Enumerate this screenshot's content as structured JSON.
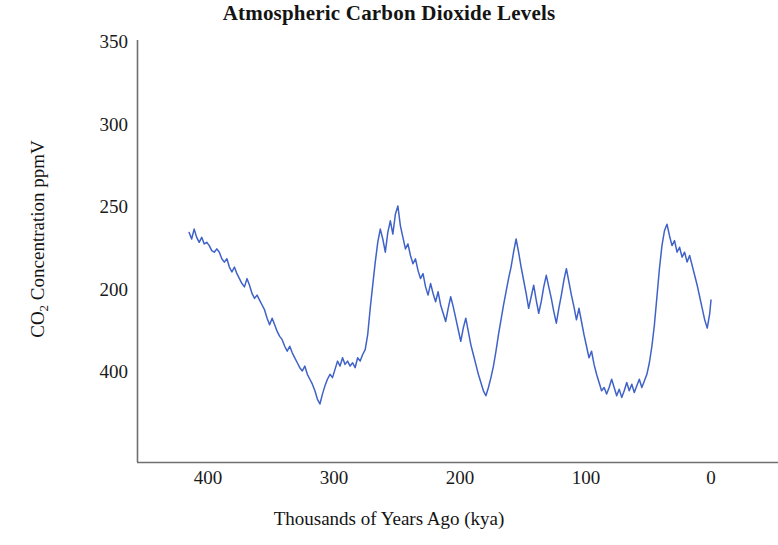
{
  "chart_data": {
    "type": "line",
    "title": "Atmospheric Carbon Dioxide Levels",
    "xlabel": "Thousands of Years Ago  (kya)",
    "ylabel": "CO2 Concentration  ppmV",
    "ylabel_parts": {
      "prefix": "CO",
      "sub": "2",
      "suffix": " Concentration  ppmV"
    },
    "series_name": "CO2 concentration",
    "series_color": "#3f62c8",
    "x_ticks": [
      "400",
      "300",
      "200",
      "100",
      "0"
    ],
    "x_tick_values": [
      400,
      300,
      200,
      100,
      0
    ],
    "y_ticks": [
      "200",
      "250",
      "300",
      "350",
      "400"
    ],
    "y_tick_values": [
      200,
      250,
      300,
      350,
      400
    ],
    "xlim": [
      420,
      -5
    ],
    "ylim": [
      160,
      400
    ],
    "x_axis_reversed": true,
    "grid": false,
    "legend": false,
    "x_units": "thousands of years ago (kya)",
    "y_units": "ppmV",
    "x": [
      415,
      413,
      411,
      409,
      407,
      405,
      403,
      401,
      399,
      397,
      395,
      393,
      391,
      389,
      387,
      385,
      383,
      381,
      379,
      377,
      375,
      373,
      371,
      369,
      367,
      365,
      363,
      361,
      359,
      357,
      355,
      353,
      351,
      349,
      347,
      345,
      343,
      341,
      339,
      337,
      335,
      333,
      331,
      329,
      327,
      325,
      323,
      321,
      319,
      317,
      315,
      313,
      311,
      309,
      307,
      305,
      303,
      301,
      299,
      297,
      295,
      293,
      291,
      289,
      287,
      285,
      283,
      281,
      279,
      277,
      275,
      273,
      271,
      269,
      267,
      265,
      263,
      261,
      259,
      257,
      255,
      253,
      251,
      249,
      247,
      245,
      243,
      241,
      239,
      237,
      235,
      233,
      231,
      229,
      227,
      225,
      223,
      221,
      219,
      217,
      215,
      213,
      211,
      209,
      207,
      205,
      203,
      201,
      199,
      197,
      195,
      193,
      191,
      189,
      187,
      185,
      183,
      181,
      179,
      177,
      175,
      173,
      171,
      169,
      167,
      165,
      163,
      161,
      159,
      157,
      155,
      153,
      151,
      149,
      147,
      145,
      143,
      141,
      139,
      137,
      135,
      133,
      131,
      129,
      127,
      125,
      123,
      121,
      119,
      117,
      115,
      113,
      111,
      109,
      107,
      105,
      103,
      101,
      99,
      97,
      95,
      93,
      91,
      89,
      87,
      85,
      83,
      81,
      79,
      77,
      75,
      73,
      71,
      69,
      67,
      65,
      63,
      61,
      59,
      57,
      55,
      53,
      51,
      49,
      47,
      45,
      43,
      41,
      39,
      37,
      35,
      33,
      31,
      29,
      27,
      25,
      23,
      21,
      19,
      17,
      15,
      13,
      11,
      9,
      7,
      5,
      3,
      1,
      0
    ],
    "y": [
      284,
      280,
      286,
      281,
      278,
      281,
      277,
      278,
      276,
      273,
      272,
      274,
      272,
      268,
      266,
      268,
      263,
      260,
      263,
      259,
      256,
      253,
      251,
      256,
      252,
      247,
      244,
      246,
      243,
      240,
      237,
      232,
      228,
      232,
      228,
      224,
      221,
      219,
      215,
      212,
      215,
      211,
      208,
      205,
      202,
      200,
      203,
      198,
      195,
      192,
      188,
      183,
      180,
      186,
      191,
      195,
      198,
      196,
      201,
      206,
      203,
      208,
      204,
      206,
      203,
      205,
      202,
      208,
      206,
      210,
      213,
      222,
      238,
      252,
      266,
      278,
      286,
      280,
      272,
      284,
      291,
      283,
      295,
      300,
      288,
      281,
      274,
      277,
      270,
      265,
      268,
      261,
      256,
      259,
      251,
      246,
      253,
      247,
      242,
      248,
      240,
      235,
      230,
      238,
      245,
      239,
      232,
      225,
      218,
      226,
      232,
      224,
      216,
      210,
      204,
      198,
      193,
      188,
      185,
      190,
      196,
      203,
      212,
      222,
      231,
      240,
      248,
      256,
      263,
      272,
      280,
      272,
      263,
      255,
      247,
      238,
      245,
      252,
      243,
      235,
      242,
      251,
      258,
      251,
      244,
      236,
      229,
      238,
      246,
      255,
      262,
      254,
      246,
      239,
      231,
      238,
      230,
      222,
      215,
      208,
      212,
      204,
      198,
      193,
      188,
      190,
      186,
      190,
      195,
      190,
      185,
      189,
      184,
      188,
      193,
      188,
      192,
      187,
      191,
      195,
      190,
      194,
      198,
      205,
      215,
      228,
      245,
      262,
      276,
      285,
      289,
      282,
      276,
      279,
      272,
      275,
      269,
      272,
      266,
      270,
      264,
      258,
      252,
      245,
      238,
      231,
      226,
      235,
      243,
      236,
      228,
      234,
      240,
      232,
      225,
      218,
      226,
      233,
      226,
      219,
      212,
      205,
      198,
      206,
      214,
      208,
      201,
      195,
      190,
      196,
      203,
      197,
      191,
      186,
      192,
      198,
      205,
      199,
      193,
      187,
      192,
      198,
      193,
      188,
      184,
      190,
      196,
      202,
      199,
      194,
      189,
      185,
      190,
      187,
      183,
      189,
      195,
      201,
      208,
      216,
      228,
      242,
      258,
      272,
      288,
      305,
      318,
      330,
      341,
      352,
      362,
      370,
      375
    ],
    "notable_points": [
      {
        "label": "modern peak",
        "x": 0,
        "y": 375
      },
      {
        "label": "interglacial peak ~320 kya",
        "x": 249,
        "y": 300
      },
      {
        "label": "interglacial peak ~130 kya",
        "x": 131,
        "y": 289
      },
      {
        "label": "glacial minimum ~350 kya",
        "x": 353,
        "y": 180
      },
      {
        "label": "glacial minimum ~20 kya",
        "x": 21,
        "y": 183
      }
    ]
  }
}
